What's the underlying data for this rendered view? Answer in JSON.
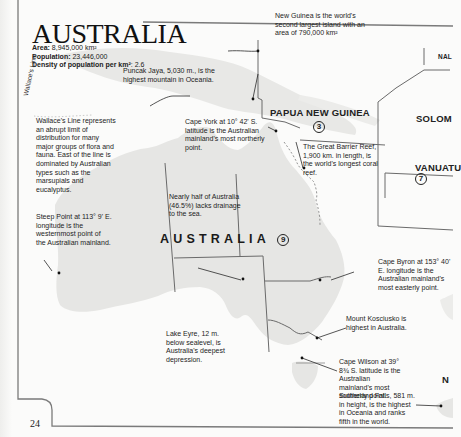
{
  "page": {
    "title": "AUSTRALIA",
    "page_number": "24"
  },
  "stats": {
    "area_label": "Area:",
    "area_value": "8,945,000 km²",
    "population_label": "Population:",
    "population_value": "23,446,000",
    "density_label": "Density of population per km²",
    "density_value": ": 2.6"
  },
  "map_labels": {
    "australia": "AUSTRALIA",
    "australia_num": "9",
    "png": "PAPUA NEW GUINEA",
    "png_num": "3",
    "solomon": "SOLOM",
    "vanuatu": "VANUATU",
    "vanuatu_num": "7",
    "nal": "NAL",
    "n_cut": "N",
    "wallace_line": "Wallace's Line"
  },
  "annotations": {
    "new_guinea": "New Guinea is the world's second largest island with an area of 790,000 km²",
    "puncak_jaya": "Puncak Jaya, 5,030 m., is the highest mountain in Oceania.",
    "wallace": "Wallace's Line represents an abrupt limit of distribution for many major groups of flora and fauna. East of the line is dominated by Australian types such as the marsupials and eucalyptus.",
    "cape_york": "Cape York at 10° 42' S. latitude is the Australian mainland's most northerly point.",
    "great_barrier_reef": "The Great Barrier Reef, 1,900 km. in length, is the world's longest coral reef.",
    "drainage": "Nearly half of Australia (46.5%) lacks drainage to the sea.",
    "steep_point": "Steep Point at 113° 9' E. longitude is the westernmost point of the Australian mainland.",
    "cape_byron": "Cape Byron at 153° 40' E. longitude is the Australian mainland's most easterly point.",
    "kosciusko": "Mount Kosciusko is highest in Australia.",
    "lake_eyre": "Lake Eyre, 12 m. below sealevel, is Australia's deepest depression.",
    "cape_wilson": "Cape Wilson at 39° 8¾ S. latitude is the Australian mainland's most southerly point.",
    "sutherland": "Sutherland Falls, 581 m. in height, is the highest in Oceania and ranks fifth in the world."
  },
  "colors": {
    "land": "#e6e6e4",
    "border": "#6a6a6a",
    "frame": "#7a7a7a",
    "reef": "#8a8a8a"
  }
}
